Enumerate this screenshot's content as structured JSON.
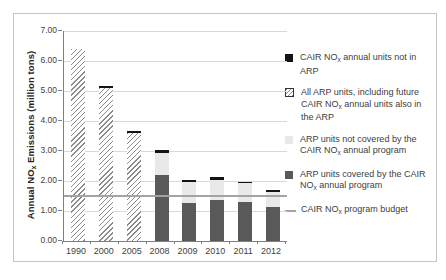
{
  "chart_data": {
    "type": "bar",
    "stacked": true,
    "title": "",
    "ylabel": "Annual NO~x~ Emissions (million tons)",
    "xlabel": "",
    "ylim": [
      0,
      7
    ],
    "ytick_labels": [
      "0.00",
      "1.00",
      "2.00",
      "3.00",
      "4.00",
      "5.00",
      "6.00",
      "7.00"
    ],
    "categories": [
      "1990",
      "2000",
      "2005",
      "2008",
      "2009",
      "2010",
      "2011",
      "2012"
    ],
    "series": [
      {
        "key": "hatch",
        "name": "All ARP units, including future CAIR NO~x~ annual units also in the ARP",
        "values": [
          6.4,
          5.1,
          3.6,
          0,
          0,
          0,
          0,
          0
        ]
      },
      {
        "key": "dark",
        "name": "ARP units covered by the CAIR NO~x~ annual program",
        "values": [
          0,
          0,
          0,
          2.2,
          1.28,
          1.38,
          1.3,
          1.12
        ]
      },
      {
        "key": "light",
        "name": "ARP units not covered by the CAIR NO~x~ annual program",
        "values": [
          0,
          0,
          0,
          0.75,
          0.69,
          0.67,
          0.62,
          0.51
        ]
      },
      {
        "key": "black",
        "name": "CAIR NO~x~ annual units not in ARP",
        "values": [
          0,
          0.07,
          0.07,
          0.1,
          0.08,
          0.07,
          0.06,
          0.07
        ]
      }
    ],
    "bar_totals": [
      6.4,
      5.17,
      3.67,
      3.05,
      2.05,
      2.12,
      1.98,
      1.7
    ],
    "budget_line": {
      "label": "CAIR NO~x~ program budget",
      "value": 1.5
    },
    "grid": true,
    "legend_position": "right",
    "legend": [
      {
        "swatch": "black",
        "label": "CAIR NO~x~ annual units not in ARP"
      },
      {
        "swatch": "hatch",
        "label": "All ARP units, including future CAIR NO~x~ annual units also in the ARP"
      },
      {
        "swatch": "light",
        "label": "ARP units not covered by the CAIR NO~x~ annual program"
      },
      {
        "swatch": "dark",
        "label": "ARP units covered by the CAIR NO~x~ annual program"
      },
      {
        "swatch": "line",
        "label": "CAIR NO~x~ program budget"
      }
    ],
    "colors": {
      "dark": "#595959",
      "light": "#ebe9e7",
      "black": "#141414",
      "hatch_line": "#8a8a8a",
      "grid_line": "#d9d9d9",
      "budget_line": "#a3a3a3",
      "axis": "#808080",
      "text": "#3f3f3f",
      "frame_border": "#c4c4c4"
    }
  }
}
